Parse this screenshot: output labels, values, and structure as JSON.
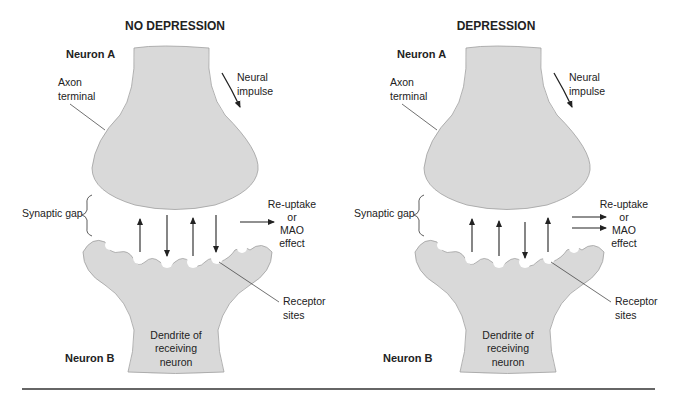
{
  "panels": [
    {
      "title": "NO DEPRESSION",
      "neuron_a": "Neuron A",
      "neuron_b": "Neuron B",
      "axon_terminal": [
        "Axon",
        "terminal"
      ],
      "neural_impulse": [
        "Neural",
        "impulse"
      ],
      "synaptic_gap": "Synaptic gap",
      "reuptake": [
        "Re-uptake",
        "or",
        "MAO",
        "effect"
      ],
      "reuptake_arrow_count": 1,
      "receptor_sites": [
        "Receptor",
        "sites"
      ],
      "dendrite": [
        "Dendrite of",
        "receiving",
        "neuron"
      ],
      "transmitter_arrows": [
        "up",
        "down",
        "up",
        "down"
      ]
    },
    {
      "title": "DEPRESSION",
      "neuron_a": "Neuron A",
      "neuron_b": "Neuron B",
      "axon_terminal": [
        "Axon",
        "terminal"
      ],
      "neural_impulse": [
        "Neural",
        "impulse"
      ],
      "synaptic_gap": "Synaptic gap",
      "reuptake": [
        "Re-uptake",
        "or",
        "MAO",
        "effect"
      ],
      "reuptake_arrow_count": 2,
      "receptor_sites": [
        "Receptor",
        "sites"
      ],
      "dendrite": [
        "Dendrite of",
        "receiving",
        "neuron"
      ],
      "transmitter_arrows": [
        "up",
        "up",
        "down",
        "up"
      ]
    }
  ],
  "colors": {
    "neuron_fill": "#d9d9d9",
    "outline": "#9a9a9a",
    "text": "#222222",
    "rule": "#333333"
  }
}
